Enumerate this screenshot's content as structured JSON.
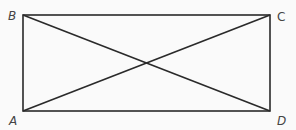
{
  "diagram": {
    "title": "",
    "stroke_color": "#2a2a2a",
    "label_color": "#444444",
    "vertices": {
      "A": {
        "label": "A",
        "x": 23,
        "y": 111
      },
      "B": {
        "label": "B",
        "x": 23,
        "y": 15
      },
      "C": {
        "label": "C",
        "x": 270,
        "y": 15
      },
      "D": {
        "label": "D",
        "x": 270,
        "y": 111
      }
    },
    "edges": [
      [
        "A",
        "B"
      ],
      [
        "B",
        "C"
      ],
      [
        "C",
        "D"
      ],
      [
        "D",
        "A"
      ]
    ],
    "diagonals": [
      [
        "A",
        "C"
      ],
      [
        "B",
        "D"
      ]
    ],
    "labels": {
      "A": "A",
      "B": "B",
      "C": "C",
      "D": "D"
    }
  }
}
